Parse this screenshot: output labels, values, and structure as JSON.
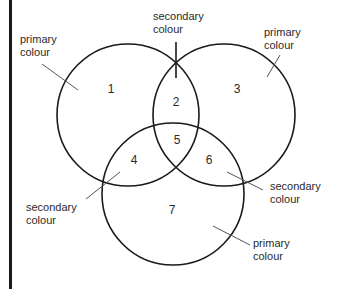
{
  "diagram": {
    "type": "venn",
    "regions": [
      {
        "id": "1",
        "label": "1",
        "x": 111,
        "y": 93
      },
      {
        "id": "2",
        "label": "2",
        "x": 176,
        "y": 106
      },
      {
        "id": "3",
        "label": "3",
        "x": 237,
        "y": 93
      },
      {
        "id": "4",
        "label": "4",
        "x": 134,
        "y": 164
      },
      {
        "id": "5",
        "label": "5",
        "x": 177,
        "y": 144
      },
      {
        "id": "6",
        "label": "6",
        "x": 209,
        "y": 164
      },
      {
        "id": "7",
        "label": "7",
        "x": 172,
        "y": 214
      }
    ],
    "circles": [
      {
        "name": "circle-top-left",
        "cx": 128,
        "cy": 115,
        "r": 71
      },
      {
        "name": "circle-top-right",
        "cx": 224,
        "cy": 115,
        "r": 71
      },
      {
        "name": "circle-bottom",
        "cx": 173,
        "cy": 194,
        "r": 71
      }
    ],
    "annotations": [
      {
        "name": "primary-colour-top-left",
        "line1": "primary",
        "line2": "colour",
        "tx": 20,
        "ty": 43,
        "lx1": 42,
        "ly1": 64,
        "lx2": 78,
        "ly2": 90
      },
      {
        "name": "secondary-colour-top",
        "line1": "secondary",
        "line2": "colour",
        "tx": 153,
        "ty": 20,
        "lx1": 176,
        "ly1": 42,
        "lx2": 176,
        "ly2": 78
      },
      {
        "name": "primary-colour-top-right",
        "line1": "primary",
        "line2": "colour",
        "tx": 264,
        "ty": 36,
        "lx1": 280,
        "ly1": 55,
        "lx2": 267,
        "ly2": 77
      },
      {
        "name": "secondary-colour-bottom-left",
        "line1": "secondary",
        "line2": "colour",
        "tx": 26,
        "ty": 211,
        "lx1": 86,
        "ly1": 199,
        "lx2": 120,
        "ly2": 172
      },
      {
        "name": "secondary-colour-bottom-right",
        "line1": "secondary",
        "line2": "colour",
        "tx": 270,
        "ty": 190,
        "lx1": 227,
        "ly1": 172,
        "lx2": 263,
        "ly2": 190
      },
      {
        "name": "primary-colour-bottom",
        "line1": "primary",
        "line2": "colour",
        "tx": 253,
        "ty": 247,
        "lx1": 213,
        "ly1": 226,
        "lx2": 250,
        "ly2": 245
      }
    ],
    "colors": {
      "stroke": "#1a1a1a",
      "leader": "#555555",
      "text": "#2a2a2a",
      "background": "#ffffff"
    }
  }
}
